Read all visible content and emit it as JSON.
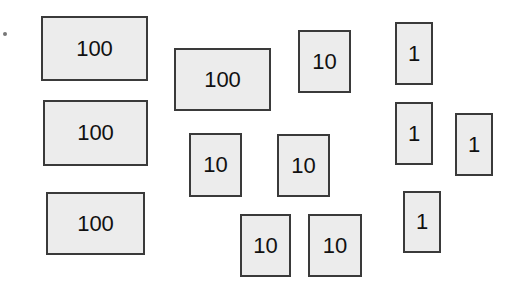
{
  "diagram": {
    "colors": {
      "fill": "#ececec",
      "border": "#3a3a3a",
      "text": "#111111"
    },
    "blocks": [
      {
        "label": "100",
        "x": 41,
        "y": 16,
        "w": 107,
        "h": 65
      },
      {
        "label": "100",
        "x": 174,
        "y": 48,
        "w": 97,
        "h": 63
      },
      {
        "label": "100",
        "x": 43,
        "y": 100,
        "w": 105,
        "h": 66
      },
      {
        "label": "100",
        "x": 46,
        "y": 192,
        "w": 99,
        "h": 63
      },
      {
        "label": "10",
        "x": 298,
        "y": 30,
        "w": 53,
        "h": 63
      },
      {
        "label": "10",
        "x": 189,
        "y": 133,
        "w": 53,
        "h": 64
      },
      {
        "label": "10",
        "x": 277,
        "y": 134,
        "w": 53,
        "h": 63
      },
      {
        "label": "10",
        "x": 240,
        "y": 214,
        "w": 51,
        "h": 63
      },
      {
        "label": "10",
        "x": 308,
        "y": 214,
        "w": 54,
        "h": 63
      },
      {
        "label": "1",
        "x": 395,
        "y": 22,
        "w": 38,
        "h": 63
      },
      {
        "label": "1",
        "x": 395,
        "y": 102,
        "w": 38,
        "h": 63
      },
      {
        "label": "1",
        "x": 455,
        "y": 113,
        "w": 38,
        "h": 63
      },
      {
        "label": "1",
        "x": 403,
        "y": 191,
        "w": 38,
        "h": 62
      }
    ],
    "totals": {
      "hundreds": 4,
      "tens": 5,
      "ones": 4
    }
  }
}
